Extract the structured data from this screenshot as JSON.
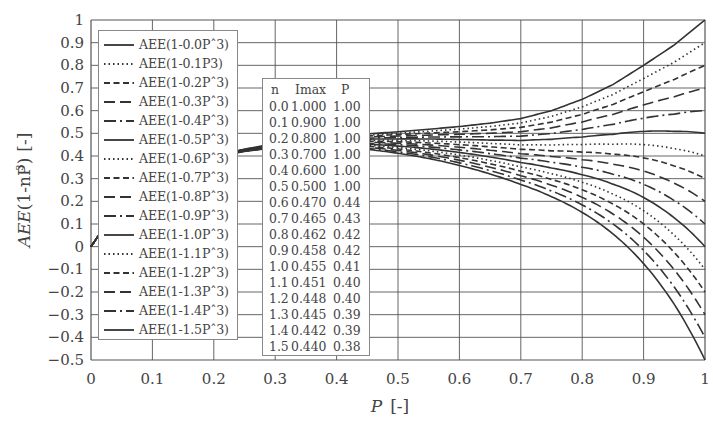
{
  "chart_data": {
    "type": "line",
    "title": "",
    "xlabel": "P [-]",
    "ylabel": "AEE(1-nP³) [-]",
    "xlim": [
      0,
      1
    ],
    "ylim": [
      -0.5,
      1
    ],
    "grid": true,
    "x_ticks": [
      "0",
      "0.1",
      "0.2",
      "0.3",
      "0.4",
      "0.5",
      "0.6",
      "0.7",
      "0.8",
      "0.9",
      "1"
    ],
    "y_ticks": [
      "1",
      "0.9",
      "0.8",
      "0.7",
      "0.6",
      "0.5",
      "0.4",
      "0.3",
      "0.2",
      "0.1",
      "0",
      "−0.1",
      "−0.2",
      "−0.3",
      "−0.4",
      "−0.5"
    ],
    "legend_position": "upper left (inside)",
    "base_curve_n0": {
      "x": [
        0,
        0.05,
        0.1,
        0.15,
        0.2,
        0.25,
        0.3,
        0.35,
        0.4,
        0.45,
        0.5,
        0.55,
        0.6,
        0.65,
        0.7,
        0.75,
        0.8,
        0.85,
        0.9,
        0.95,
        1.0
      ],
      "y": [
        0,
        0.2,
        0.3,
        0.36,
        0.4,
        0.43,
        0.455,
        0.472,
        0.485,
        0.497,
        0.507,
        0.518,
        0.53,
        0.545,
        0.565,
        0.6,
        0.65,
        0.715,
        0.8,
        0.89,
        1.0
      ]
    },
    "series": [
      {
        "name": "AEE(1-0.0P^3)",
        "n": 0.0,
        "style": "solid",
        "value_at_P1": 1.0
      },
      {
        "name": "AEE(1-0.1P3)",
        "n": 0.1,
        "style": "dotted",
        "value_at_P1": 0.9
      },
      {
        "name": "AEE(1-0.2P^3)",
        "n": 0.2,
        "style": "dashed",
        "value_at_P1": 0.8
      },
      {
        "name": "AEE(1-0.3P^3)",
        "n": 0.3,
        "style": "longdash",
        "value_at_P1": 0.7
      },
      {
        "name": "AEE(1-0.4P^3)",
        "n": 0.4,
        "style": "dashdot",
        "value_at_P1": 0.6
      },
      {
        "name": "AEE(1-0.5P^3)",
        "n": 0.5,
        "style": "solid",
        "value_at_P1": 0.5
      },
      {
        "name": "AEE(1-0.6P^3)",
        "n": 0.6,
        "style": "dotted",
        "value_at_P1": 0.4
      },
      {
        "name": "AEE(1-0.7P^3)",
        "n": 0.7,
        "style": "dashed",
        "value_at_P1": 0.3
      },
      {
        "name": "AEE(1-0.8P^3)",
        "n": 0.8,
        "style": "longdash",
        "value_at_P1": 0.2
      },
      {
        "name": "AEE(1-0.9P^3)",
        "n": 0.9,
        "style": "dashdot",
        "value_at_P1": 0.1
      },
      {
        "name": "AEE(1-1.0P^3)",
        "n": 1.0,
        "style": "solid",
        "value_at_P1": 0.0
      },
      {
        "name": "AEE(1-1.1P^3)",
        "n": 1.1,
        "style": "dotted",
        "value_at_P1": -0.1
      },
      {
        "name": "AEE(1-1.2P^3)",
        "n": 1.2,
        "style": "dashed",
        "value_at_P1": -0.2
      },
      {
        "name": "AEE(1-1.3P^3)",
        "n": 1.3,
        "style": "longdash",
        "value_at_P1": -0.3
      },
      {
        "name": "AEE(1-1.4P^3)",
        "n": 1.4,
        "style": "dashdot",
        "value_at_P1": -0.4
      },
      {
        "name": "AEE(1-1.5P^3)",
        "n": 1.5,
        "style": "solid",
        "value_at_P1": -0.5
      }
    ],
    "annotation_table": {
      "headers": [
        "n",
        "Imax",
        "P"
      ],
      "rows": [
        [
          "0.0",
          "1.000",
          "1.00"
        ],
        [
          "0.1",
          "0.900",
          "1.00"
        ],
        [
          "0.2",
          "0.800",
          "1.00"
        ],
        [
          "0.3",
          "0.700",
          "1.00"
        ],
        [
          "0.4",
          "0.600",
          "1.00"
        ],
        [
          "0.5",
          "0.500",
          "1.00"
        ],
        [
          "0.6",
          "0.470",
          "0.44"
        ],
        [
          "0.7",
          "0.465",
          "0.43"
        ],
        [
          "0.8",
          "0.462",
          "0.42"
        ],
        [
          "0.9",
          "0.458",
          "0.42"
        ],
        [
          "1.0",
          "0.455",
          "0.41"
        ],
        [
          "1.1",
          "0.451",
          "0.40"
        ],
        [
          "1.2",
          "0.448",
          "0.40"
        ],
        [
          "1.3",
          "0.445",
          "0.39"
        ],
        [
          "1.4",
          "0.442",
          "0.39"
        ],
        [
          "1.5",
          "0.440",
          "0.38"
        ]
      ]
    }
  },
  "legend": {
    "labels": [
      "AEE(1-0.0Pˆ3)",
      "AEE(1-0.1P3)",
      "AEE(1-0.2Pˆ3)",
      "AEE(1-0.3Pˆ3)",
      "AEE(1-0.4Pˆ3)",
      "AEE(1-0.5Pˆ3)",
      "AEE(1-0.6Pˆ3)",
      "AEE(1-0.7Pˆ3)",
      "AEE(1-0.8Pˆ3)",
      "AEE(1-0.9Pˆ3)",
      "AEE(1-1.0Pˆ3)",
      "AEE(1-1.1Pˆ3)",
      "AEE(1-1.2Pˆ3)",
      "AEE(1-1.3Pˆ3)",
      "AEE(1-1.4Pˆ3)",
      "AEE(1-1.5Pˆ3)"
    ]
  },
  "axes": {
    "xlabel_main": "P",
    "xlabel_unit": "[-]",
    "ylabel_main": "AEE",
    "ylabel_paren": "(1-nP",
    "ylabel_sup": "3",
    "ylabel_close": ")",
    "ylabel_unit": "[-]"
  },
  "colors": {
    "line": "#333333",
    "grid": "#555555",
    "text": "#444444"
  }
}
